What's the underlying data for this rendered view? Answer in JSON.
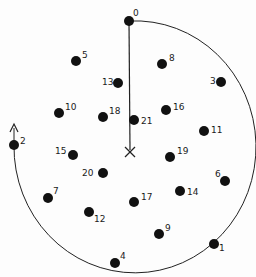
{
  "diagram": {
    "colors": {
      "ink": "#111111",
      "background": "#fdfdfd"
    },
    "center_marker": "X",
    "points": [
      {
        "label": "0",
        "on_path": true
      },
      {
        "label": "1",
        "on_path": true
      },
      {
        "label": "2",
        "on_path": true
      },
      {
        "label": "3",
        "on_path": false
      },
      {
        "label": "4",
        "on_path": false
      },
      {
        "label": "5",
        "on_path": false
      },
      {
        "label": "6",
        "on_path": false
      },
      {
        "label": "7",
        "on_path": false
      },
      {
        "label": "8",
        "on_path": false
      },
      {
        "label": "9",
        "on_path": false
      },
      {
        "label": "10",
        "on_path": false
      },
      {
        "label": "11",
        "on_path": false
      },
      {
        "label": "12",
        "on_path": false
      },
      {
        "label": "13",
        "on_path": false
      },
      {
        "label": "14",
        "on_path": false
      },
      {
        "label": "15",
        "on_path": false
      },
      {
        "label": "16",
        "on_path": false
      },
      {
        "label": "17",
        "on_path": false
      },
      {
        "label": "18",
        "on_path": false
      },
      {
        "label": "19",
        "on_path": false
      },
      {
        "label": "20",
        "on_path": false
      },
      {
        "label": "21",
        "on_path": false
      }
    ],
    "path": {
      "from": "0",
      "through": [
        "1"
      ],
      "to": "2",
      "direction": "clockwise",
      "arrow": "continues upward past 2"
    }
  }
}
